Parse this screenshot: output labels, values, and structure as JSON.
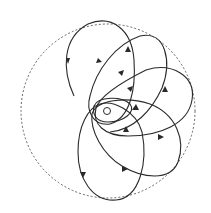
{
  "diagram": {
    "boundary": {
      "cx": 108,
      "cy": 111,
      "r": 87,
      "style": "dashed"
    },
    "focus": {
      "cx": 107,
      "cy": 111,
      "r": 3.5
    },
    "colors": {
      "stroke": "#2a2a2a",
      "background": "#ffffff"
    },
    "loops": 5
  }
}
